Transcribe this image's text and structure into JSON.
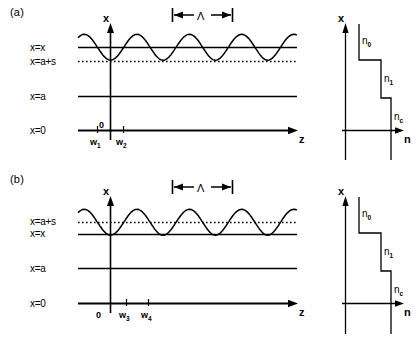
{
  "figure": {
    "type": "scientific-diagram",
    "stroke_color": "#000000",
    "background_color": "#ffffff"
  },
  "panels": [
    {
      "id": "a",
      "label": "(a)",
      "main_plot": {
        "vertical_axis_label": "x",
        "horizontal_axis_label": "z",
        "origin_tick_label": "0",
        "period_label": "Λ",
        "level_labels": [
          {
            "name": "x-equals-x",
            "text": "x=x",
            "style": "solid"
          },
          {
            "name": "x-equals-a-s",
            "text": "x=a+s",
            "style": "dotted"
          },
          {
            "name": "x-equals-a",
            "text": "x=a",
            "style": "solid"
          },
          {
            "name": "x-equals-0",
            "text": "x=0",
            "style": "solid"
          }
        ],
        "tick_labels": [
          {
            "base": "w",
            "sub": "1"
          },
          {
            "base": "w",
            "sub": "2"
          }
        ]
      },
      "index_plot": {
        "vertical_axis_label": "x",
        "horizontal_axis_label": "n",
        "steps": [
          {
            "base": "n",
            "sub": "0"
          },
          {
            "base": "n",
            "sub": "1"
          },
          {
            "base": "n",
            "sub": "c"
          }
        ]
      }
    },
    {
      "id": "b",
      "label": "(b)",
      "main_plot": {
        "vertical_axis_label": "x",
        "horizontal_axis_label": "z",
        "origin_tick_label": "0",
        "period_label": "Λ",
        "level_labels": [
          {
            "name": "x-equals-a-s",
            "text": "x=a+s",
            "style": "dotted"
          },
          {
            "name": "x-equals-x",
            "text": "x=x",
            "style": "solid"
          },
          {
            "name": "x-equals-a",
            "text": "x=a",
            "style": "solid"
          },
          {
            "name": "x-equals-0",
            "text": "x=0",
            "style": "solid"
          }
        ],
        "tick_labels": [
          {
            "base": "w",
            "sub": "3"
          },
          {
            "base": "w",
            "sub": "4"
          }
        ]
      },
      "index_plot": {
        "vertical_axis_label": "x",
        "horizontal_axis_label": "n",
        "steps": [
          {
            "base": "n",
            "sub": "0"
          },
          {
            "base": "n",
            "sub": "1"
          },
          {
            "base": "n",
            "sub": "c"
          }
        ]
      }
    }
  ]
}
